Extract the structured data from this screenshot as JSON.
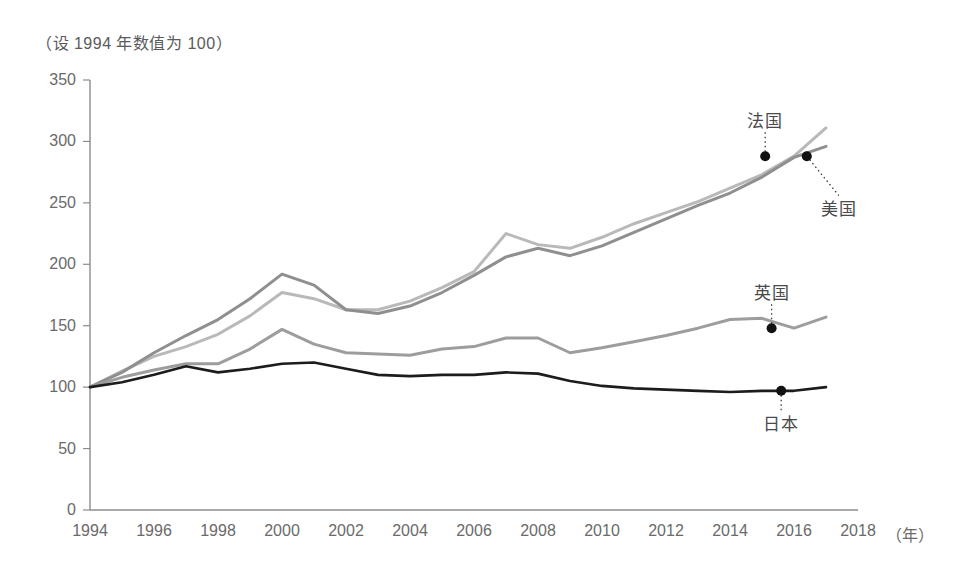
{
  "chart_data": {
    "type": "line",
    "title": "（设 1994 年数值为 100）",
    "xlabel": "（年）",
    "ylabel": "",
    "xlim": [
      1994,
      2018
    ],
    "ylim": [
      0,
      350
    ],
    "y_ticks": [
      0,
      50,
      100,
      150,
      200,
      250,
      300,
      350
    ],
    "x_ticks": [
      1994,
      1996,
      1998,
      2000,
      2002,
      2004,
      2006,
      2008,
      2010,
      2012,
      2014,
      2016,
      2018
    ],
    "grid": false,
    "legend_position": "inline-annotations",
    "x": [
      1994,
      1995,
      1996,
      1997,
      1998,
      1999,
      2000,
      2001,
      2002,
      2003,
      2004,
      2005,
      2006,
      2007,
      2008,
      2009,
      2010,
      2011,
      2012,
      2013,
      2014,
      2015,
      2016,
      2017
    ],
    "series": [
      {
        "name": "法国",
        "color": "#b9b9b9",
        "label_x": 2015.1,
        "label_y": 318,
        "marker_x": 2015.1,
        "marker_y": 288,
        "values": [
          100,
          113,
          125,
          133,
          143,
          158,
          177,
          172,
          163,
          163,
          170,
          181,
          194,
          225,
          216,
          213,
          222,
          233,
          242,
          251,
          262,
          273,
          288,
          311
        ]
      },
      {
        "name": "美国",
        "color": "#8f8f8f",
        "label_x": 2017.4,
        "label_y": 247,
        "marker_x": 2016.4,
        "marker_y": 288,
        "values": [
          100,
          112,
          128,
          142,
          155,
          172,
          192,
          183,
          163,
          160,
          166,
          177,
          191,
          206,
          213,
          207,
          215,
          226,
          237,
          248,
          258,
          271,
          287,
          296
        ]
      },
      {
        "name": "英国",
        "color": "#9d9d9d",
        "label_x": 2015.3,
        "label_y": 178,
        "marker_x": 2015.3,
        "marker_y": 148,
        "values": [
          100,
          108,
          114,
          119,
          119,
          131,
          147,
          135,
          128,
          127,
          126,
          131,
          133,
          140,
          140,
          128,
          132,
          137,
          142,
          148,
          155,
          156,
          148,
          157
        ]
      },
      {
        "name": "日本",
        "color": "#1c1c1c",
        "label_x": 2015.6,
        "label_y": 72,
        "marker_x": 2015.6,
        "marker_y": 97,
        "values": [
          100,
          104,
          110,
          117,
          112,
          115,
          119,
          120,
          115,
          110,
          109,
          110,
          110,
          112,
          111,
          105,
          101,
          99,
          98,
          97,
          96,
          97,
          97,
          100
        ]
      }
    ]
  },
  "axes": {
    "y_tick_labels": [
      "350",
      "300",
      "250",
      "200",
      "150",
      "100",
      "50",
      "0"
    ],
    "x_tick_labels": [
      "1994",
      "1996",
      "1998",
      "2000",
      "2002",
      "2004",
      "2006",
      "2008",
      "2010",
      "2012",
      "2014",
      "2016",
      "2018"
    ],
    "x_unit": "（年）"
  }
}
